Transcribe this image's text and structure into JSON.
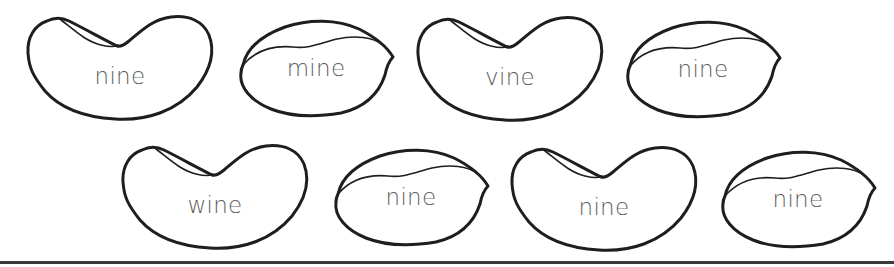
{
  "worksheet": {
    "rows": [
      {
        "beans": [
          {
            "word": "nine",
            "shape": "kidney"
          },
          {
            "word": "mine",
            "shape": "oval"
          },
          {
            "word": "vine",
            "shape": "kidney"
          },
          {
            "word": "nine",
            "shape": "oval"
          }
        ]
      },
      {
        "beans": [
          {
            "word": "wine",
            "shape": "kidney"
          },
          {
            "word": "nine",
            "shape": "oval"
          },
          {
            "word": "nine",
            "shape": "kidney"
          },
          {
            "word": "nine",
            "shape": "oval"
          }
        ]
      }
    ],
    "colors": {
      "outline": "#1e1e1e",
      "text": "#3a3a3a",
      "baseline": "#3a3a3a",
      "background": "#ffffff"
    }
  }
}
